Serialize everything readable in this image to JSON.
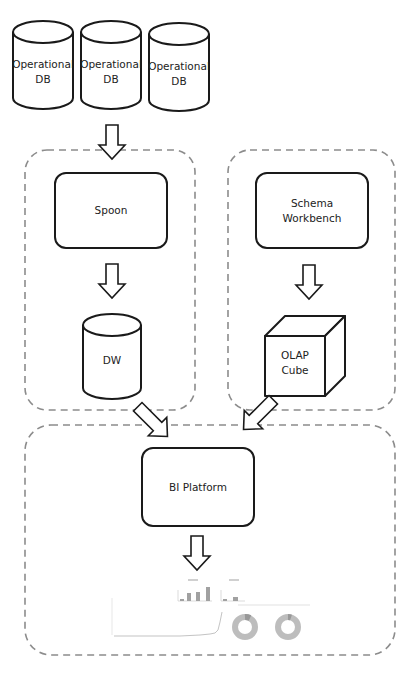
{
  "diagram": {
    "type": "architecture-flow",
    "sources": [
      {
        "id": "opdb1",
        "label": "Operational\nDB",
        "shape": "cylinder"
      },
      {
        "id": "opdb2",
        "label": "Operational\nDB",
        "shape": "cylinder"
      },
      {
        "id": "opdb3",
        "label": "Operational\nDB",
        "shape": "cylinder"
      }
    ],
    "groups": [
      {
        "id": "etl-group",
        "nodes": [
          "spoon",
          "dw"
        ]
      },
      {
        "id": "olap-group",
        "nodes": [
          "schema-workbench",
          "olap-cube"
        ]
      },
      {
        "id": "bi-group",
        "nodes": [
          "bi-platform",
          "dashboard"
        ]
      }
    ],
    "nodes": {
      "spoon": {
        "label": "Spoon",
        "shape": "rounded-rect"
      },
      "schema_workbench": {
        "label": "Schema\nWorkbench",
        "shape": "rounded-rect"
      },
      "dw": {
        "label": "DW",
        "shape": "cylinder"
      },
      "olap_cube": {
        "label": "OLAP\nCube",
        "shape": "cube"
      },
      "bi_platform": {
        "label": "BI Platform",
        "shape": "rounded-rect"
      },
      "dashboard": {
        "label": "",
        "shape": "dashboard-thumbnail"
      }
    },
    "edges": [
      {
        "from": "operational-dbs",
        "to": "spoon"
      },
      {
        "from": "spoon",
        "to": "dw"
      },
      {
        "from": "schema-workbench",
        "to": "olap-cube"
      },
      {
        "from": "dw",
        "to": "bi-platform"
      },
      {
        "from": "olap-cube",
        "to": "bi-platform"
      },
      {
        "from": "bi-platform",
        "to": "dashboard"
      }
    ],
    "colors": {
      "stroke": "#1a1a1a",
      "dashed_group": "#8c8c8c",
      "background": "#ffffff"
    }
  }
}
